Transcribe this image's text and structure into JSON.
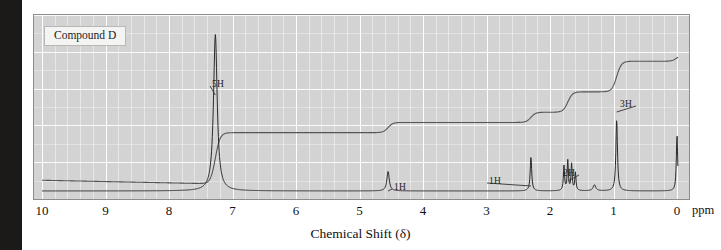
{
  "figure": {
    "compound_label": "Compound D",
    "axis_title": "Chemical Shift (δ)",
    "ppm_unit": "ppm",
    "tick_labels": [
      "10",
      "9",
      "8",
      "7",
      "6",
      "5",
      "4",
      "3",
      "2",
      "1",
      "0"
    ],
    "tick_values": [
      10,
      9,
      8,
      7,
      6,
      5,
      4,
      3,
      2,
      1,
      0
    ],
    "colors": {
      "plot_background": "#d3d3d3",
      "grid_line": "#ffffff",
      "trace": "#2b2b2b",
      "integration_trace": "#555555",
      "frame": "#8d8d8d",
      "scan_gutter": "#1c1a18"
    },
    "annotations": [
      {
        "label": "5H",
        "x_ppm": 7.27,
        "note": "aromatic multiplet"
      },
      {
        "label": "1H",
        "x_ppm": 4.55,
        "note": "methine"
      },
      {
        "label": "1H",
        "x_ppm": 2.3,
        "note": "singlet"
      },
      {
        "label": "2H",
        "x_ppm": 1.72,
        "note": "multiplet"
      },
      {
        "label": "3H",
        "x_ppm": 0.95,
        "note": "triplet"
      }
    ]
  },
  "chart_data": {
    "type": "line",
    "title": "Compound D",
    "xlabel": "Chemical Shift (δ)",
    "ylabel": "",
    "xlim": [
      10,
      0
    ],
    "ylim": [
      0,
      1
    ],
    "x_unit": "ppm",
    "grid": true,
    "legend": "none",
    "axis_direction": "reversed",
    "series": [
      {
        "name": "1H NMR spectrum",
        "type": "line",
        "peaks": [
          {
            "shift_ppm": 7.27,
            "height": 0.92,
            "width_ppm": 0.07,
            "integration_H": 5,
            "label": "5H"
          },
          {
            "shift_ppm": 4.55,
            "height": 0.115,
            "width_ppm": 0.045,
            "integration_H": 1,
            "label": "1H"
          },
          {
            "shift_ppm": 2.3,
            "height": 0.2,
            "width_ppm": 0.028,
            "integration_H": 1,
            "label": "1H"
          },
          {
            "shift_ppm": 1.78,
            "height": 0.145,
            "width_ppm": 0.022,
            "integration_H": 2,
            "label": "2H"
          },
          {
            "shift_ppm": 1.72,
            "height": 0.175,
            "width_ppm": 0.022,
            "integration_H": 2,
            "label": "2H"
          },
          {
            "shift_ppm": 1.66,
            "height": 0.155,
            "width_ppm": 0.022,
            "integration_H": 2,
            "label": "2H"
          },
          {
            "shift_ppm": 1.6,
            "height": 0.105,
            "width_ppm": 0.022,
            "integration_H": 2,
            "label": "2H"
          },
          {
            "shift_ppm": 1.3,
            "height": 0.035,
            "width_ppm": 0.05,
            "integration_H": 0,
            "label": ""
          },
          {
            "shift_ppm": 0.95,
            "height": 0.42,
            "width_ppm": 0.03,
            "integration_H": 3,
            "label": "3H"
          },
          {
            "shift_ppm": 0.0,
            "height": 0.33,
            "width_ppm": 0.025,
            "integration_H": 0,
            "label": "TMS"
          }
        ]
      },
      {
        "name": "Integration trace",
        "type": "step",
        "steps": [
          {
            "shift_ppm": 7.27,
            "rise": 0.3,
            "protons": 5
          },
          {
            "shift_ppm": 4.55,
            "rise": 0.06,
            "protons": 1
          },
          {
            "shift_ppm": 2.3,
            "rise": 0.06,
            "protons": 1
          },
          {
            "shift_ppm": 1.72,
            "rise": 0.12,
            "protons": 2
          },
          {
            "shift_ppm": 0.95,
            "rise": 0.18,
            "protons": 3
          },
          {
            "shift_ppm": 0.0,
            "rise": 0.04,
            "protons": 0
          }
        ]
      }
    ]
  }
}
